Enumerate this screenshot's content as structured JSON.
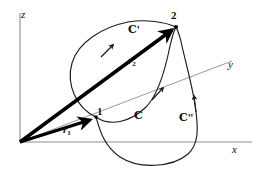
{
  "figure": {
    "type": "vector-path-diagram",
    "background_color": "#ffffff",
    "ink_color": "#111111",
    "axis_color": "#8d8d8d",
    "vector_color": "#000000",
    "curve_color": "#1a1a1a"
  },
  "axes": [
    {
      "id": "z",
      "label": "z",
      "orientation": "vertical-up",
      "label_x": 21,
      "label_y": 9
    },
    {
      "id": "y",
      "label": "y",
      "orientation": "diagonal-up-right",
      "label_x": 228,
      "label_y": 59
    },
    {
      "id": "x",
      "label": "x",
      "orientation": "horizontal-right",
      "label_x": 232,
      "label_y": 144
    }
  ],
  "origin": {
    "x": 20,
    "y": 142
  },
  "points": [
    {
      "id": "p1",
      "label": "1",
      "x": 96,
      "y": 117,
      "label_x": 97,
      "label_y": 106
    },
    {
      "id": "p2",
      "label": "2",
      "x": 176,
      "y": 27,
      "label_x": 171,
      "label_y": 10
    }
  ],
  "vectors": [
    {
      "id": "r1",
      "label": "r",
      "subscript": "1",
      "from": "origin",
      "to": "p1",
      "label_x": 63,
      "label_y": 124
    },
    {
      "id": "r2",
      "label": "r",
      "subscript": "2",
      "from": "origin",
      "to": "p2",
      "label_x": 128,
      "label_y": 55
    }
  ],
  "curves": [
    {
      "id": "C",
      "label": "C",
      "prime": "",
      "label_x": 134,
      "label_y": 110,
      "arrow_at": "mid"
    },
    {
      "id": "Cprime",
      "label": "C",
      "prime": "'",
      "label_x": 128,
      "label_y": 24,
      "arrow_at": "mid"
    },
    {
      "id": "Cdprime",
      "label": "C",
      "prime": "''",
      "label_x": 179,
      "label_y": 112,
      "arrow_at": "mid"
    }
  ]
}
